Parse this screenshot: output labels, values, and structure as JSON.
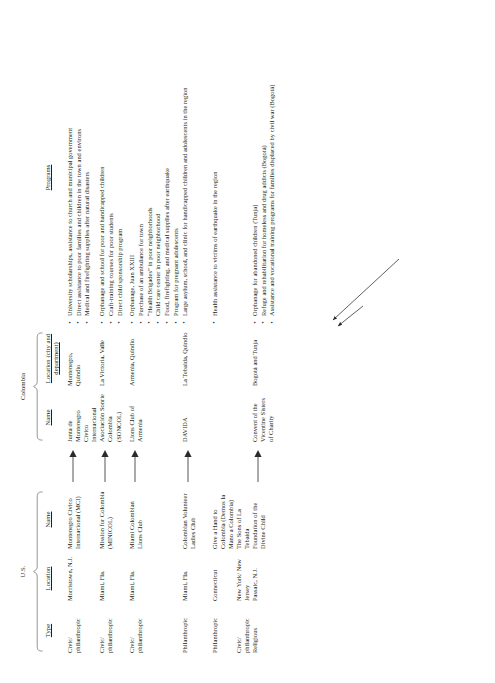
{
  "document": {
    "group_headers": [
      {
        "label": "U.S."
      },
      {
        "label": "Colombia"
      }
    ],
    "columns": [
      {
        "key": "type",
        "label": "Type"
      },
      {
        "key": "us_location",
        "label": "Location"
      },
      {
        "key": "us_name",
        "label": "Name"
      },
      {
        "key": "link",
        "label": ""
      },
      {
        "key": "col_name",
        "label": "Name"
      },
      {
        "key": "col_location",
        "label": "Location (city and department)"
      },
      {
        "key": "programs",
        "label": "Programs"
      }
    ],
    "rows": [
      {
        "type": "Civic/ philanthropic",
        "us_location": "Morristown, N.J.",
        "us_name": "Montenegro Civico Internacional (MCI)",
        "col_name": "Junta de Montenegro Civico Internacional",
        "col_location": "Montenegro, Quindio",
        "programs": [
          "University scholarships, assistance to church and municipal government",
          "Direct assistance to poor families and children in the town and environs",
          "Medical and firefighting supplies after natural disasters"
        ]
      },
      {
        "type": "Civic/ philanthropic",
        "us_location": "Miami, Fla.",
        "us_name": "Mission for Colombia (MINICOL)",
        "col_name": "Asociación Sonríe Colombia (SONCOL)",
        "col_location": "La Victoria, Valle",
        "programs": [
          "Orphanage and school for poor and handicapped children",
          "Craft-training courses for poor students",
          "Direct child sponsorship program"
        ]
      },
      {
        "type": "Civic/ philanthropic",
        "us_location": "Miami, Fla.",
        "us_name": "Miami Colombian Lions Club",
        "col_name": "Lions Club of Armenia",
        "col_location": "Armenia, Quindio",
        "programs": [
          "Orphanage, Juan XXIII",
          "Purchase of an ambulance for town",
          "“Health Brigades” in poor neighborhoods",
          "Child care center in poor neighborhood",
          "Food, firefighting, and medical supplies after earthquake",
          "Program for pregnant adolescents"
        ]
      },
      {
        "type": "Philanthropic",
        "us_location": "Miami, Fla.",
        "us_name": "Colombian Volunteer Ladies Club",
        "col_name": "DAVIDA",
        "col_location": "La Tebaida, Quindio",
        "programs": [
          "Large asylum, school, and clinic for handicapped children and adolescents in the region"
        ]
      },
      {
        "type": "Philanthropic",
        "us_location": "Connecticut",
        "us_name": "Give a Hand to Colombia (Demos la Mano a Colombia)",
        "col_name": "",
        "col_location": "",
        "programs": [
          "Health assistance to victims of earthquake in the region"
        ]
      },
      {
        "type": "Civic/ philanthropic",
        "us_location": "New York/ New Jersey",
        "us_name": "The Sons of La Tebaida",
        "col_name": "",
        "col_location": "",
        "programs": []
      },
      {
        "type": "Religious",
        "us_location": "Passaic, N.J.",
        "us_name": "Foundation of the Divine Child",
        "col_name": "Convent of the Vicentine Sisters of Charity",
        "col_location": "Bogotá and Tunja",
        "programs": [
          "Orphanage for abandoned children (Tunja)",
          "Refuge and rehabilitation for homeless and drug addicts (Bogotá)",
          "Assistance and vocational training programs for families displaced by civil war (Bogotá)"
        ]
      }
    ],
    "link_arrows": {
      "row1": "single-arrow",
      "row2": "single-arrow",
      "row3": "single-arrow",
      "row4": "single-arrow",
      "row5": "converging-arrow-to-davida",
      "row6": "converging-arrow-to-davida",
      "row7": "single-arrow"
    },
    "colors": {
      "text": "#231f20",
      "rule": "#4a4a4a",
      "background": "#ffffff"
    }
  }
}
